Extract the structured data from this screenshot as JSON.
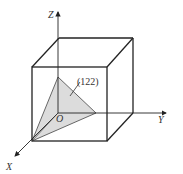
{
  "diagram": {
    "axes": {
      "x_label": "X",
      "y_label": "Y",
      "z_label": "Z",
      "origin_label": "O"
    },
    "plane_label": "(122)",
    "colors": {
      "line": "#222222",
      "plane_fill": "#dcdcdc",
      "text": "#333333"
    }
  }
}
